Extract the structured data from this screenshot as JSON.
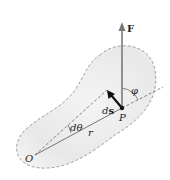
{
  "diagram": {
    "colors": {
      "body_fill": "#e9e9e9",
      "outline": "#8a8a8a",
      "force": "#7a7a7a",
      "ds_vector": "#111111",
      "lines": "#555555"
    },
    "labels": {
      "force": "F",
      "phi": "φ",
      "ds_d": "d",
      "ds_s": "s",
      "point_p": "P",
      "dtheta": "dθ",
      "r": "r",
      "origin": "O"
    }
  }
}
